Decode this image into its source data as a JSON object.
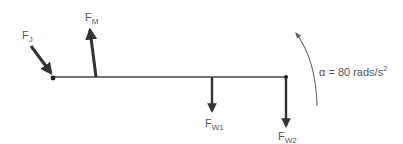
{
  "diagram": {
    "type": "free-body diagram",
    "colors": {
      "beam": "#333333",
      "arrow": "#333333",
      "text": "#555555",
      "curve": "#666666"
    },
    "beam": {
      "x1": 53,
      "y1": 77,
      "x2": 286,
      "y2": 77
    },
    "forces": [
      {
        "id": "F_J",
        "label": "F",
        "sub": "J",
        "direction": "down-right, into joint"
      },
      {
        "id": "F_M",
        "label": "F",
        "sub": "M",
        "direction": "up, slightly leaning left"
      },
      {
        "id": "F_W1",
        "label": "F",
        "sub": "W1",
        "direction": "down"
      },
      {
        "id": "F_W2",
        "label": "F",
        "sub": "W2",
        "direction": "down"
      }
    ],
    "angular_acceleration": {
      "symbol": "α",
      "equals": "= 80 rads/s",
      "exponent": "2",
      "direction": "counter-clockwise"
    }
  }
}
